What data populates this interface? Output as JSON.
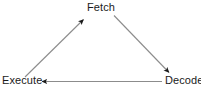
{
  "diagram": {
    "type": "cycle-diagram",
    "background_color": "#ffffff",
    "line_color": "#8c8c8c",
    "arrowhead_color": "#1a1a1a",
    "text_color": "#1a1a1a",
    "nodes": [
      {
        "id": "fetch",
        "label": "Fetch",
        "position": "top-center"
      },
      {
        "id": "decode",
        "label": "Decode",
        "position": "bottom-right"
      },
      {
        "id": "execute",
        "label": "Execute",
        "position": "bottom-left"
      }
    ],
    "edges": [
      {
        "id": "fetch-to-decode",
        "from": "Fetch",
        "to": "Decode",
        "direction": "down-right"
      },
      {
        "id": "decode-to-execute",
        "from": "Decode",
        "to": "Execute",
        "direction": "left"
      },
      {
        "id": "execute-to-fetch",
        "from": "Execute",
        "to": "Fetch",
        "direction": "up-right"
      }
    ]
  }
}
